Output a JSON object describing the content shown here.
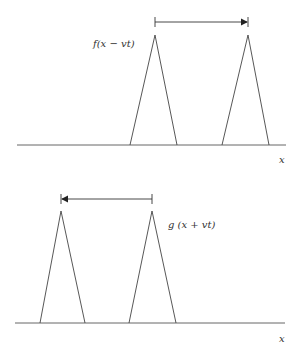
{
  "top_panel": {
    "label": "f(x − vt)",
    "axis_label": "x",
    "arrow_direction": "right",
    "pulses": [
      {
        "left": 130,
        "peak": 155,
        "right": 177
      },
      {
        "left": 222,
        "peak": 248,
        "right": 269
      }
    ],
    "baseline_y": 145,
    "peak_y": 35,
    "arrow": {
      "from": 155,
      "to": 248,
      "y": 22
    }
  },
  "bottom_panel": {
    "label": "g (x + vt)",
    "axis_label": "x",
    "arrow_direction": "left",
    "pulses": [
      {
        "left": 40,
        "peak": 61,
        "right": 85
      },
      {
        "left": 129,
        "peak": 152,
        "right": 176
      }
    ],
    "baseline_y": 323,
    "peak_y": 211,
    "arrow": {
      "from": 152,
      "to": 61,
      "y": 199
    }
  }
}
